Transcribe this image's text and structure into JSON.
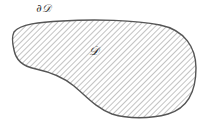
{
  "diagram": {
    "type": "region-with-boundary",
    "region_label": "𝒟",
    "boundary_label": "∂𝒟",
    "fill_pattern": "diagonal-hatch",
    "colors": {
      "outline": "#555555",
      "hatch": "#9a9a9a",
      "background": "#ffffff",
      "text": "#333333"
    }
  }
}
